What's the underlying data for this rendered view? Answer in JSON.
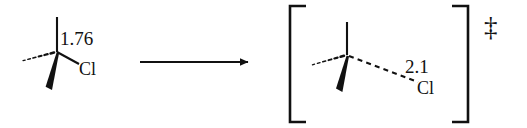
{
  "figure": {
    "type": "reaction-scheme",
    "background_color": "#ffffff",
    "stroke_color": "#111111"
  },
  "reactant": {
    "name": "chloroalkane-reactant",
    "center_atom": "C",
    "bond_distance_label": "1.76",
    "leaving_group_label": "Cl",
    "bonds": [
      {
        "name": "plain-bond-up",
        "style": "plain"
      },
      {
        "name": "hashed-bond-left",
        "style": "hashed"
      },
      {
        "name": "wedge-bond-down",
        "style": "wedge"
      },
      {
        "name": "plain-bond-to-cl",
        "style": "plain"
      }
    ]
  },
  "arrow": {
    "name": "reaction-arrow",
    "direction": "right",
    "label": ""
  },
  "transition_state": {
    "name": "transition-state-complex",
    "center_atom": "C",
    "bond_distance_label": "2.1",
    "leaving_group_label": "Cl",
    "bracket_left": "[",
    "bracket_right": "]",
    "superscript_symbol": "‡",
    "bonds": [
      {
        "name": "plain-bond-up",
        "style": "plain"
      },
      {
        "name": "hashed-bond-left",
        "style": "hashed"
      },
      {
        "name": "wedge-bond-down",
        "style": "wedge"
      },
      {
        "name": "hashed-bond-to-cl",
        "style": "hashed"
      }
    ]
  }
}
